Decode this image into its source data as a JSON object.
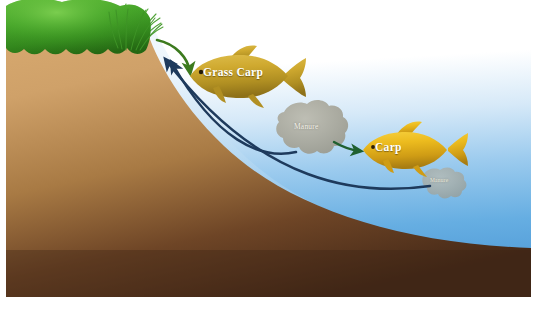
{
  "figure": {
    "type": "illustration"
  },
  "canvas": {
    "width": 535,
    "height": 314,
    "background_color": "#ffffff"
  },
  "labels": {
    "grass_carp": "Grass Carp",
    "carp": "Carp",
    "manure_large": "Manure",
    "manure_small": "Manure"
  },
  "regions": [
    {
      "name": "vegetation",
      "label": "grass bank vegetation",
      "color_top": "#4aa72e",
      "color_bottom": "#2f7a1c"
    },
    {
      "name": "soil",
      "label": "earth bank",
      "color_top": "#cfa169",
      "color_bottom": "#4a2c18"
    },
    {
      "name": "water",
      "label": "pond water",
      "color_top": "#ffffff",
      "color_bottom": "#4f9ede"
    }
  ],
  "organisms": [
    {
      "name": "grass-carp",
      "label": "Grass Carp",
      "body_color": "#c9a227",
      "facing": "left",
      "x": 245,
      "y": 78
    },
    {
      "name": "carp",
      "label": "Carp",
      "body_color": "#e8b318",
      "facing": "left",
      "x": 410,
      "y": 150
    }
  ],
  "matter": [
    {
      "name": "manure-large",
      "label": "Manure",
      "color": "#a8a79b",
      "x": 312,
      "y": 130
    },
    {
      "name": "manure-small",
      "label": "Manure",
      "color": "#a9a89c",
      "x": 442,
      "y": 185
    }
  ],
  "arrows": [
    {
      "name": "grass-to-grass-carp",
      "color": "#3c7a1e",
      "from": "vegetation",
      "to": "grass-carp",
      "style": "curved"
    },
    {
      "name": "manure-to-carp",
      "color": "#1f6030",
      "from": "manure-large",
      "to": "carp",
      "style": "straight"
    },
    {
      "name": "manure-large-to-bank",
      "color": "#1e3a5c",
      "from": "manure-large",
      "to": "bank",
      "style": "curved"
    },
    {
      "name": "manure-small-to-bank",
      "color": "#1e3a5c",
      "from": "manure-small",
      "to": "bank",
      "style": "curved"
    }
  ]
}
